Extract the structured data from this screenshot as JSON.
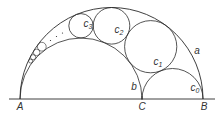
{
  "diagram": {
    "stroke_color": "#2a2a2a",
    "text_color": "#333333",
    "baseline": {
      "x1": 9,
      "x2": 215,
      "y": 99
    },
    "points": {
      "A": {
        "label": "A",
        "x": 20,
        "y": 99
      },
      "C": {
        "label": "C",
        "x": 142,
        "y": 99
      },
      "B": {
        "label": "B",
        "x": 203,
        "y": 99
      }
    },
    "arcs": {
      "a": {
        "label": "a",
        "cx": 111.5,
        "r": 91.5
      },
      "b": {
        "label": "b",
        "cx": 81,
        "r": 61
      },
      "c0": {
        "label": "c",
        "sub": "0",
        "cx": 172.5,
        "r": 30.5
      }
    },
    "chain": [
      {
        "name": "c1",
        "label": "c",
        "sub": "1",
        "cx": 150.7,
        "cy": 46.7,
        "r": 26.1
      },
      {
        "name": "c2",
        "label": "c",
        "sub": "2",
        "cx": 111.5,
        "cy": 25.8,
        "r": 18.3
      },
      {
        "name": "c3",
        "label": "c",
        "sub": "3",
        "cx": 81.0,
        "cy": 25.8,
        "r": 12.2
      },
      {
        "name": "c6",
        "cx": 41.8,
        "cy": 46.7,
        "r": 4.4
      },
      {
        "name": "c7",
        "cx": 36.6,
        "cy": 52.4,
        "r": 3.3
      },
      {
        "name": "c8",
        "cx": 33.1,
        "cy": 57.2,
        "r": 2.6
      },
      {
        "name": "c9",
        "cx": 30.6,
        "cy": 61.1,
        "r": 2.0
      }
    ],
    "ellipsis_dots": [
      {
        "x": 50.5,
        "y": 40.5
      },
      {
        "x": 56.5,
        "y": 36.5
      },
      {
        "x": 62.5,
        "y": 33.0
      }
    ],
    "labels": [
      {
        "id": "A",
        "text": "A",
        "sub": "",
        "x": 20,
        "y": 107
      },
      {
        "id": "C",
        "text": "C",
        "sub": "",
        "x": 142,
        "y": 107
      },
      {
        "id": "B",
        "text": "B",
        "sub": "",
        "x": 204,
        "y": 107
      },
      {
        "id": "a",
        "text": "a",
        "sub": "",
        "x": 197,
        "y": 51
      },
      {
        "id": "b",
        "text": "b",
        "sub": "",
        "x": 134,
        "y": 87
      },
      {
        "id": "c0",
        "text": "c",
        "sub": "0",
        "x": 195,
        "y": 88
      },
      {
        "id": "c1",
        "text": "c",
        "sub": "1",
        "x": 158,
        "y": 62
      },
      {
        "id": "c2",
        "text": "c",
        "sub": "2",
        "x": 119,
        "y": 30
      },
      {
        "id": "c3",
        "text": "c",
        "sub": "3",
        "x": 88,
        "y": 24
      }
    ]
  }
}
